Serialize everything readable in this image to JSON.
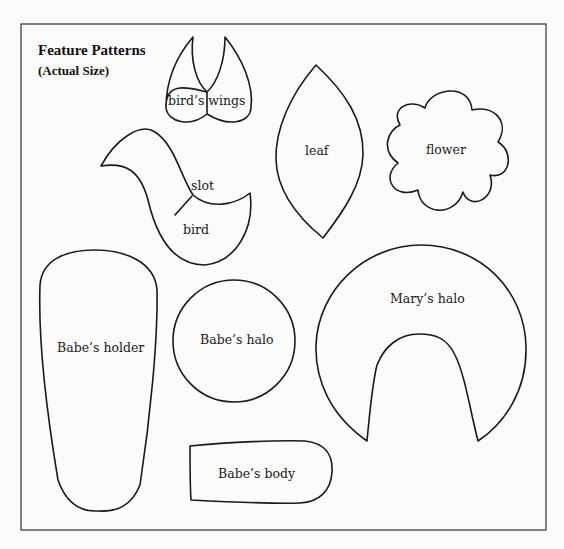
{
  "title": "Feature Patterns",
  "subtitle": "(Actual Size)",
  "patterns": {
    "birds_wings": "bird’s wings",
    "leaf": "leaf",
    "flower": "flower",
    "slot": "slot",
    "bird": "bird",
    "babes_holder": "Babe’s holder",
    "babes_halo": "Babe’s halo",
    "marys_halo": "Mary’s halo",
    "babes_body": "Babe’s body"
  }
}
